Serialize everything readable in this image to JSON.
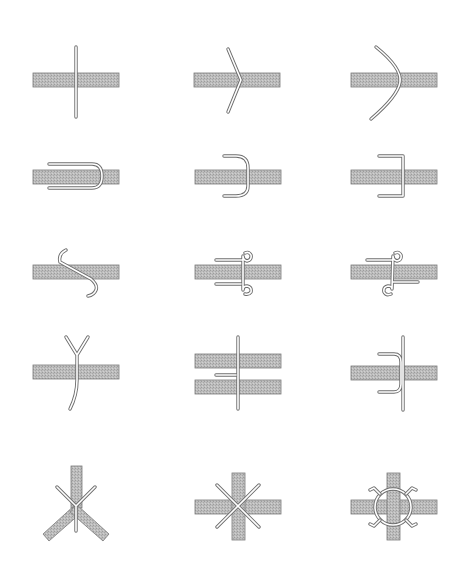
{
  "diagram": {
    "title": "",
    "layout": {
      "columns": 3,
      "rows": 5
    },
    "colors": {
      "background": "#ffffff",
      "band_fill": "#b8b8b8",
      "band_edge": "#7a7a7a",
      "wire_outline": "#6e6e6e",
      "wire_core": "#ffffff"
    },
    "panels": [
      {
        "id": "straight-pin",
        "row": 1,
        "col": 1,
        "description": "Straight wire passing vertically through a horizontal band"
      },
      {
        "id": "sharp-v-bend",
        "row": 1,
        "col": 2,
        "description": "Wire bent into a sharp V (chevron) pointing right, apex on the band"
      },
      {
        "id": "curved-bend",
        "row": 1,
        "col": 3,
        "description": "Wire bent into a smooth curve bulging right across the band"
      },
      {
        "id": "round-u-hairpin",
        "row": 2,
        "col": 1,
        "description": "Horizontal U hairpin with rounded end straddling the band"
      },
      {
        "id": "round-u-staple",
        "row": 2,
        "col": 2,
        "description": "Rounded U staple, legs pointing left, back crossing the band"
      },
      {
        "id": "square-u-staple",
        "row": 2,
        "col": 3,
        "description": "Square-cornered U staple crossing the band"
      },
      {
        "id": "s-hook",
        "row": 3,
        "col": 1,
        "description": "S-shaped hook wire crossing the band diagonally"
      },
      {
        "id": "double-loop-same-side",
        "row": 3,
        "col": 2,
        "description": "Wire with two eye loops, both tails extending left"
      },
      {
        "id": "double-loop-opposite-side",
        "row": 3,
        "col": 3,
        "description": "Wire with two eye loops, tails extending in opposite directions"
      },
      {
        "id": "y-split",
        "row": 4,
        "col": 1,
        "description": "Wire splitting into a Y above the band"
      },
      {
        "id": "double-band-pin",
        "row": 4,
        "col": 2,
        "description": "Vertical pin through two parallel bands with a side tab between"
      },
      {
        "id": "hooked-pin",
        "row": 4,
        "col": 3,
        "description": "Vertical pin with two curved hooks wrapping the band"
      },
      {
        "id": "three-way-junction",
        "row": 5,
        "col": 1,
        "description": "Three bands meeting in a Y junction tied with a Y-shaped wire"
      },
      {
        "id": "cross-junction-x-tie",
        "row": 5,
        "col": 2,
        "description": "Four-way band cross tied with a diagonal X wire"
      },
      {
        "id": "cross-junction-ring-tie",
        "row": 5,
        "col": 3,
        "description": "Four-way band cross tied with a ring and four diagonal spurs"
      }
    ]
  }
}
